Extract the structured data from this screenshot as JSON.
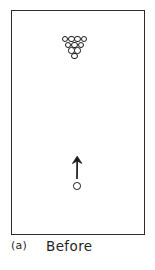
{
  "figure": {
    "name": "billiards-break-before",
    "caption_label": "(a)",
    "caption_text": "Before",
    "style": "hand-drawn line art",
    "ink_color": "#1f1f1f",
    "background_color": "#ffffff"
  },
  "table": {
    "name": "pool-table",
    "shape": "rectangle",
    "border_color": "#2b2b2b",
    "fill_color": "#ffffff"
  },
  "rack": {
    "name": "ball-rack",
    "description": "triangular rack of balls, apex pointing down",
    "ball_count": 10,
    "rows": [
      4,
      3,
      2,
      1
    ],
    "ball_outline_color": "#1a1a1a",
    "ball_fill_color": "#ffffff"
  },
  "cue_ball": {
    "name": "cue-ball",
    "label": "",
    "outline_color": "#1a1a1a",
    "fill_color": "#ffffff"
  },
  "arrow": {
    "name": "motion-arrow",
    "direction": "up",
    "color": "#1a1a1a",
    "meaning": "cue ball velocity before collision"
  }
}
